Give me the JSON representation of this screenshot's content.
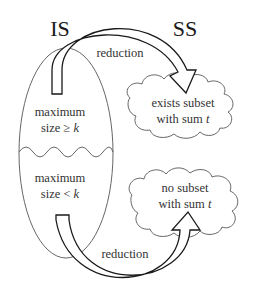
{
  "diagram": {
    "left_set": {
      "title": "IS",
      "regions": [
        {
          "line1": "maximum",
          "line2_prefix": "size ",
          "relation": "≥",
          "variable": "k"
        },
        {
          "line1": "maximum",
          "line2_prefix": "size ",
          "relation": "<",
          "variable": "k"
        }
      ]
    },
    "right_set": {
      "title": "SS",
      "clouds": [
        {
          "line1": "exists subset",
          "line2_prefix": "with sum ",
          "variable": "t"
        },
        {
          "line1": "no subset",
          "line2_prefix": "with sum ",
          "variable": "t"
        }
      ]
    },
    "arrows": [
      {
        "label": "reduction",
        "from": "maximum size ≥ k",
        "to": "exists subset with sum t"
      },
      {
        "label": "reduction",
        "from": "maximum size < k",
        "to": "no subset with sum t"
      }
    ],
    "colors": {
      "stroke_thin": "#555555",
      "stroke_arrow": "#1a1a1a",
      "text": "#333333",
      "background": "#ffffff"
    }
  }
}
